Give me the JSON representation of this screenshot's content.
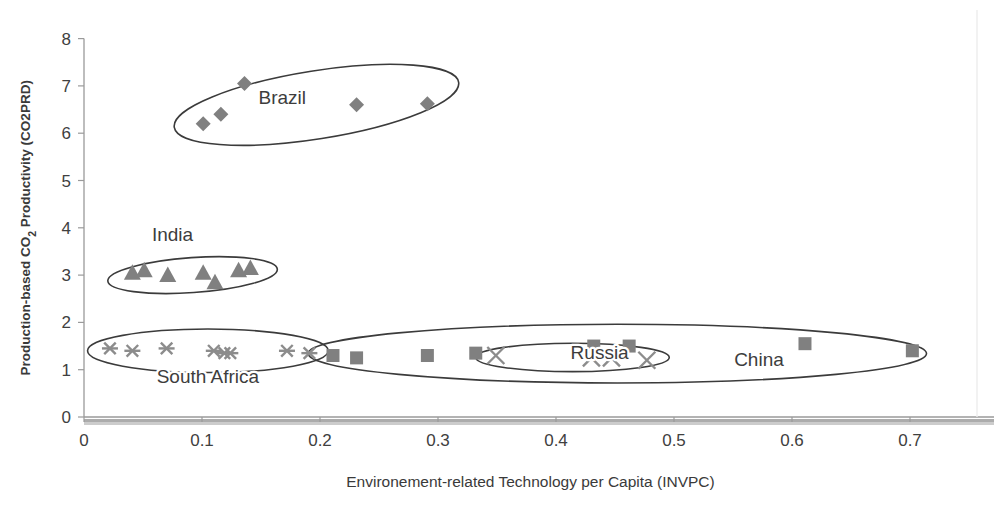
{
  "chart_data": {
    "type": "scatter",
    "title": "",
    "xlabel": "Environement-related Technology per Capita (INVPC)",
    "ylabel": "Production-based CO2 Productivity (CO2PRD)",
    "ylabel_parts": {
      "pre": "Production-based CO",
      "sub": "2",
      "post": " Productivity (CO2PRD)"
    },
    "xlim": [
      0,
      0.75
    ],
    "ylim": [
      0,
      8
    ],
    "xticks": [
      0,
      0.1,
      0.2,
      0.3,
      0.4,
      0.5,
      0.6,
      0.7
    ],
    "xtick_labels": [
      "0",
      "0.1",
      "0.2",
      "0.3",
      "0.4",
      "0.5",
      "0.6",
      "0.7"
    ],
    "yticks": [
      0,
      1,
      2,
      3,
      4,
      5,
      6,
      7,
      8
    ],
    "ytick_labels": [
      "0",
      "1",
      "2",
      "3",
      "4",
      "5",
      "6",
      "7",
      "8"
    ],
    "grid": false,
    "legend": "none",
    "marker_color": "#808080",
    "annotation_color": "#3b3b3b",
    "series": [
      {
        "name": "Brazil",
        "marker": "diamond",
        "label": "Brazil",
        "label_x": 0.168,
        "label_y": 6.62,
        "points": [
          {
            "x": 0.101,
            "y": 6.2
          },
          {
            "x": 0.116,
            "y": 6.4
          },
          {
            "x": 0.136,
            "y": 7.05
          },
          {
            "x": 0.231,
            "y": 6.6
          },
          {
            "x": 0.291,
            "y": 6.62
          }
        ],
        "ellipse": {
          "cx": 0.197,
          "cy": 6.6,
          "rx": 0.122,
          "ry": 0.72,
          "rotate": -9
        }
      },
      {
        "name": "India",
        "marker": "triangle",
        "label": "India",
        "label_x": 0.075,
        "label_y": 3.72,
        "points": [
          {
            "x": 0.041,
            "y": 3.05
          },
          {
            "x": 0.051,
            "y": 3.1
          },
          {
            "x": 0.071,
            "y": 3.0
          },
          {
            "x": 0.101,
            "y": 3.05
          },
          {
            "x": 0.111,
            "y": 2.85
          },
          {
            "x": 0.131,
            "y": 3.1
          },
          {
            "x": 0.141,
            "y": 3.15
          }
        ],
        "ellipse": {
          "cx": 0.092,
          "cy": 3.0,
          "rx": 0.072,
          "ry": 0.37,
          "rotate": -4
        }
      },
      {
        "name": "South Africa",
        "marker": "star",
        "label": "South Africa",
        "label_x": 0.105,
        "label_y": 0.72,
        "points": [
          {
            "x": 0.022,
            "y": 1.45
          },
          {
            "x": 0.041,
            "y": 1.4
          },
          {
            "x": 0.07,
            "y": 1.45
          },
          {
            "x": 0.11,
            "y": 1.4
          },
          {
            "x": 0.119,
            "y": 1.35
          },
          {
            "x": 0.124,
            "y": 1.35
          },
          {
            "x": 0.172,
            "y": 1.4
          },
          {
            "x": 0.191,
            "y": 1.35
          }
        ],
        "ellipse": {
          "cx": 0.105,
          "cy": 1.4,
          "rx": 0.102,
          "ry": 0.46,
          "rotate": 0
        }
      },
      {
        "name": "China",
        "marker": "square",
        "label": "China",
        "label_x": 0.572,
        "label_y": 1.07,
        "points": [
          {
            "x": 0.211,
            "y": 1.3
          },
          {
            "x": 0.231,
            "y": 1.25
          },
          {
            "x": 0.291,
            "y": 1.3
          },
          {
            "x": 0.332,
            "y": 1.35
          },
          {
            "x": 0.432,
            "y": 1.5
          },
          {
            "x": 0.462,
            "y": 1.5
          },
          {
            "x": 0.611,
            "y": 1.55
          },
          {
            "x": 0.702,
            "y": 1.4
          }
        ],
        "ellipse": {
          "cx": 0.452,
          "cy": 1.34,
          "rx": 0.262,
          "ry": 0.62,
          "rotate": 0
        }
      },
      {
        "name": "Russia",
        "marker": "xmark",
        "label": "Russia",
        "label_x": 0.437,
        "label_y": 1.23,
        "points": [
          {
            "x": 0.349,
            "y": 1.3
          },
          {
            "x": 0.43,
            "y": 1.25
          },
          {
            "x": 0.447,
            "y": 1.25
          },
          {
            "x": 0.477,
            "y": 1.2
          }
        ],
        "ellipse": {
          "cx": 0.414,
          "cy": 1.26,
          "rx": 0.082,
          "ry": 0.3,
          "rotate": 0
        }
      }
    ]
  }
}
